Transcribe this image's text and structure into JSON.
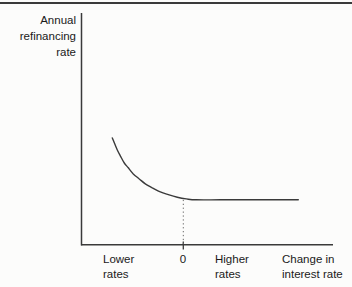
{
  "figure": {
    "y_axis_title": "Annual\nrefinancing\nrate",
    "x_axis_title": "Change in\ninterest rate",
    "x_tick_labels": {
      "lower": "Lower\nrates",
      "zero": "0",
      "higher": "Higher\nrates"
    }
  },
  "colors": {
    "background": "#fcfcfb",
    "line": "#3a3a3a",
    "text": "#1a1a1a",
    "dotted_guide": "#6a6a6a",
    "top_rule": "#3a3a3a"
  },
  "chart_data": {
    "type": "line",
    "title": "",
    "xlabel": "Change in interest rate",
    "ylabel": "Annual refinancing rate",
    "x_tick_labels": [
      "Lower rates",
      "0",
      "Higher rates"
    ],
    "x_tick_positions": [
      -0.8,
      0,
      0.5
    ],
    "xlim": [
      -1.02,
      1.49
    ],
    "ylim": [
      0,
      1
    ],
    "grid": false,
    "legend": false,
    "series": [
      {
        "name": "annual-refinancing-rate-curve",
        "description": "Convex decreasing curve: refinancing rate is high when interest rates fall, declines as the change in interest rate rises, and levels off at a constant floor for increases in the interest rate.",
        "points": [
          [
            -0.71,
            0.461
          ],
          [
            -0.69,
            0.44
          ],
          [
            -0.66,
            0.409
          ],
          [
            -0.63,
            0.384
          ],
          [
            -0.59,
            0.353
          ],
          [
            -0.55,
            0.332
          ],
          [
            -0.5,
            0.306
          ],
          [
            -0.44,
            0.284
          ],
          [
            -0.38,
            0.263
          ],
          [
            -0.31,
            0.246
          ],
          [
            -0.23,
            0.228
          ],
          [
            -0.15,
            0.216
          ],
          [
            -0.06,
            0.205
          ],
          [
            0.03,
            0.198
          ],
          [
            0.13,
            0.194
          ],
          [
            0.37,
            0.194
          ],
          [
            0.67,
            0.194
          ],
          [
            1.15,
            0.194
          ]
        ]
      }
    ],
    "annotations": [
      {
        "type": "dotted-vline",
        "x": 0,
        "y_from": 0,
        "y_to": 0.194
      },
      {
        "type": "axis-tick",
        "x": 0,
        "label": "0"
      }
    ]
  }
}
